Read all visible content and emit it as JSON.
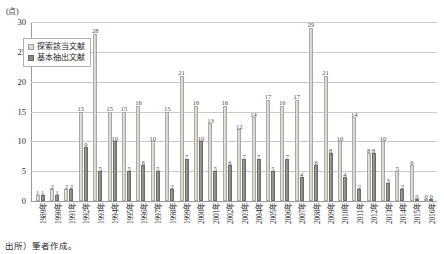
{
  "figure": {
    "title_strip": "",
    "source_note": "出所）筆者作成。"
  },
  "legend": {
    "position": "top-left-inside",
    "entries": [
      {
        "label": "探索該当文献",
        "color": "#dcdbd5",
        "icon": "legend-swatch"
      },
      {
        "label": "基本抽出文献",
        "color": "#8a8a85",
        "icon": "legend-swatch"
      }
    ]
  },
  "chart_data": {
    "type": "bar",
    "title": "",
    "subtitle": "",
    "xlabel": "",
    "ylabel": "(点)",
    "ylim": [
      0,
      30
    ],
    "yticks": [
      0,
      5,
      10,
      15,
      20,
      25,
      30
    ],
    "grid": true,
    "legend_position": "top-left-inside",
    "categories": [
      "1989年",
      "1990年",
      "1991年",
      "1992年",
      "1993年",
      "1994年",
      "1995年",
      "1996年",
      "1997年",
      "1998年",
      "1999年",
      "2000年",
      "2001年",
      "2002年",
      "2003年",
      "2004年",
      "2005年",
      "2006年",
      "2007年",
      "2008年",
      "2009年",
      "2010年",
      "2011年",
      "2012年",
      "2013年",
      "2014年",
      "2015年",
      "2016年"
    ],
    "series": [
      {
        "name": "探索該当文献",
        "color": "#dcdbd5",
        "values": [
          1,
          2,
          2,
          15,
          28,
          15,
          15,
          16,
          10,
          15,
          21,
          16,
          13,
          16,
          12,
          14,
          17,
          16,
          17,
          29,
          21,
          10,
          14,
          8,
          10,
          5,
          6,
          0
        ]
      },
      {
        "name": "基本抽出文献",
        "color": "#8a8a85",
        "values": [
          1,
          1,
          2,
          9,
          5,
          10,
          5,
          6,
          5,
          2,
          7,
          10,
          5,
          6,
          7,
          7,
          5,
          7,
          4,
          6,
          8,
          4,
          2,
          8,
          3,
          2,
          0,
          0
        ]
      }
    ],
    "bar_value_labels": true
  }
}
